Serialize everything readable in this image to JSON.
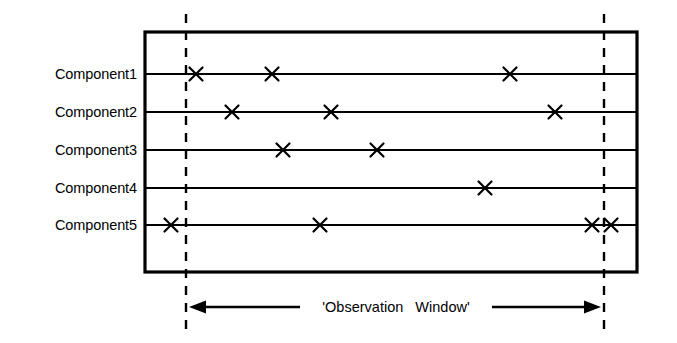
{
  "figure": {
    "type": "timeline-diagram",
    "background_color": "#ffffff",
    "line_color": "#000000",
    "canvas": {
      "width": 677,
      "height": 343
    }
  },
  "frame": {
    "name": "outer-rectangle",
    "x": 145,
    "y": 32,
    "width": 492,
    "height": 240,
    "stroke_width": 3.2
  },
  "observation_window": {
    "label": "'Observation   Window'",
    "label_x": 396,
    "label_y": 307,
    "left_boundary_x": 186,
    "right_boundary_x": 604,
    "boundary_top_y": 14,
    "boundary_bottom_y": 333,
    "dash_stroke_width": 2.4,
    "dash_pattern": "9 8",
    "arrow_y": 307,
    "left_arrow": {
      "from_x": 300,
      "to_x": 189
    },
    "right_arrow": {
      "from_x": 492,
      "to_x": 601
    }
  },
  "rows": [
    {
      "label": "Component1",
      "line_y": 74,
      "label_x": 137,
      "events": [
        196,
        272,
        510
      ]
    },
    {
      "label": "Component2",
      "line_y": 112,
      "label_x": 137,
      "events": [
        232,
        331,
        555
      ]
    },
    {
      "label": "Component3",
      "line_y": 150,
      "label_x": 137,
      "events": [
        283,
        377
      ]
    },
    {
      "label": "Component4",
      "line_y": 188,
      "label_x": 137,
      "events": [
        485
      ]
    },
    {
      "label": "Component5",
      "line_y": 225,
      "label_x": 137,
      "events": [
        171,
        320,
        592,
        611
      ]
    }
  ],
  "event_marker": {
    "glyph": "x-mark",
    "half_size": 6.5,
    "stroke_width": 2.2
  },
  "row_line": {
    "stroke_width": 2.0
  }
}
